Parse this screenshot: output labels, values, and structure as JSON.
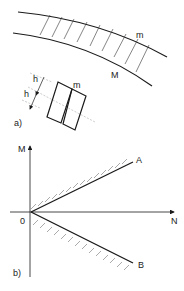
{
  "figure_a": {
    "label": "a)",
    "beam_label_inner": "m",
    "beam_label_outer": "M",
    "block_label": "m",
    "dimension_labels": [
      "h",
      "h"
    ]
  },
  "figure_b": {
    "label": "b)",
    "y_axis": "M",
    "x_axis": "N",
    "origin": "0",
    "line_upper": "A",
    "line_lower": "B"
  },
  "colors": {
    "stroke": "#1a1a1a",
    "hatch": "#555555",
    "dash": "#aaaaaa",
    "text": "#222222"
  }
}
